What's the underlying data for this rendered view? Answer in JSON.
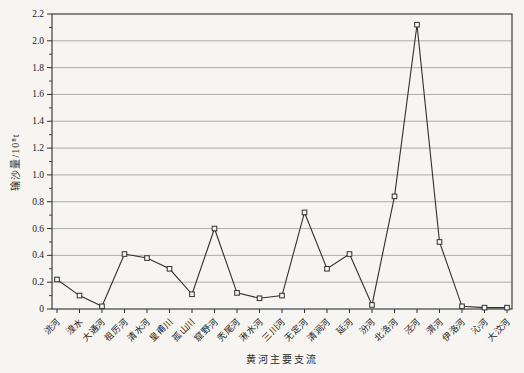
{
  "page": {
    "background": "#f6f5f1"
  },
  "colors": {
    "ink": "#2f2f2f",
    "grid": "#9a9a9a",
    "paper": "#f6f5f1",
    "marker_fill": "#f7f6f2"
  },
  "chart_data": {
    "type": "line",
    "title": "",
    "xlabel": "黄河主要支流",
    "ylabel": "输沙量/10⁸t",
    "categories": [
      "洮河",
      "湟水",
      "大通河",
      "祖厉河",
      "清水河",
      "皇甫川",
      "孤山川",
      "窟野河",
      "秃尾河",
      "湫水河",
      "三川河",
      "无定河",
      "清涧河",
      "延河",
      "汾河",
      "北洛河",
      "泾河",
      "渭河",
      "伊洛河",
      "沁河",
      "大汶河"
    ],
    "values": [
      0.22,
      0.1,
      0.02,
      0.41,
      0.38,
      0.3,
      0.11,
      0.6,
      0.12,
      0.08,
      0.1,
      0.72,
      0.3,
      0.41,
      0.03,
      0.84,
      2.12,
      0.5,
      0.02,
      0.01,
      0.01
    ],
    "ylim": [
      0,
      2.2
    ],
    "ytick_step": 0.2,
    "ytick_labels": [
      "0",
      "0.2",
      "0.4",
      "0.6",
      "0.8",
      "1.0",
      "1.2",
      "1.4",
      "1.6",
      "1.8",
      "2.0",
      "2.2"
    ],
    "minor_ytick_step": 0.1,
    "grid": "horizontal-major",
    "legend": "none",
    "marker": "open-square",
    "x_label_rotation_deg": -45
  }
}
